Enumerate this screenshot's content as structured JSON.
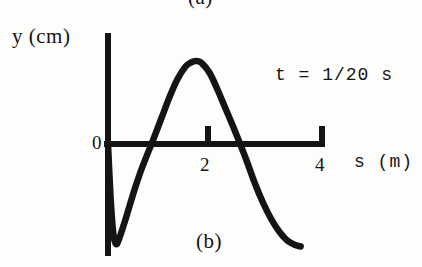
{
  "figure": {
    "sublabel_top": "(a)",
    "sublabel_bottom": "(b)",
    "annotation": "t = 1/20 s",
    "ink_color": "#141414",
    "background_color": "#fdfdfc"
  },
  "axes": {
    "y_axis_label": "y (cm)",
    "x_axis_label": "s (m)",
    "origin_label": "0",
    "x_ticks": [
      {
        "label": "2",
        "value": 2
      },
      {
        "label": "4",
        "value": 4
      }
    ]
  },
  "chart_data": {
    "type": "line",
    "title": "(b)",
    "subtitle": "t = 1/20 s",
    "xlabel": "s (m)",
    "ylabel": "y (cm)",
    "xlim": [
      0,
      4.2
    ],
    "ylim": [
      -2.2,
      1.75
    ],
    "grid": false,
    "legend": false,
    "annotations": [
      {
        "text": "t = 1/20 s",
        "x": 3.1,
        "y": 1.1
      },
      {
        "text": "(a)",
        "x": 1.9,
        "y": 2.1
      },
      {
        "text": "(b)",
        "x": 1.85,
        "y": -2.05
      }
    ],
    "xticks": [
      0,
      2,
      4
    ],
    "xticklabels": [
      "0",
      "2",
      "4"
    ],
    "yticks": [],
    "yticklabels": [],
    "series": [
      {
        "name": "wave snapshot at t = 1/20 s",
        "description": "sinusoidal pulse: starts at y=0 on the axis, dips to a trough near s=0.15, rises through zero near s=0.85, peaks near s=1.65, falls through zero near s=2.6 and descends off the figure near s=3.6",
        "x": [
          0.0,
          0.05,
          0.1,
          0.15,
          0.2,
          0.3,
          0.4,
          0.5,
          0.6,
          0.7,
          0.85,
          1.0,
          1.15,
          1.3,
          1.45,
          1.55,
          1.65,
          1.75,
          1.9,
          2.05,
          2.2,
          2.35,
          2.5,
          2.6,
          2.75,
          2.9,
          3.05,
          3.2,
          3.35,
          3.5,
          3.6
        ],
        "y": [
          0.0,
          -1.1,
          -1.8,
          -2.0,
          -1.92,
          -1.6,
          -1.25,
          -0.9,
          -0.58,
          -0.3,
          0.1,
          0.52,
          0.94,
          1.3,
          1.55,
          1.63,
          1.66,
          1.62,
          1.42,
          1.08,
          0.7,
          0.32,
          -0.08,
          -0.36,
          -0.8,
          -1.18,
          -1.5,
          -1.75,
          -1.93,
          -2.02,
          -2.05
        ]
      }
    ]
  }
}
